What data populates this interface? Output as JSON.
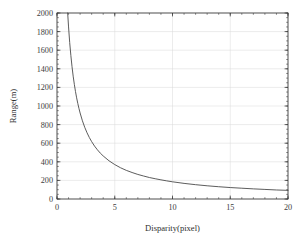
{
  "chart_data": {
    "type": "line",
    "title": "",
    "subtitle": "",
    "xlabel": "Disparity(pixel)",
    "ylabel": "Range(m)",
    "xlim": [
      0,
      20
    ],
    "ylim": [
      0,
      2000
    ],
    "xticks": [
      0,
      5,
      10,
      15,
      20
    ],
    "xtick_labels": [
      "0",
      "5",
      "10",
      "15",
      "20"
    ],
    "yticks": [
      0,
      200,
      400,
      600,
      800,
      1000,
      1200,
      1400,
      1600,
      1800,
      2000
    ],
    "ytick_labels": [
      "0",
      "200",
      "400",
      "600",
      "800",
      "1000",
      "1200",
      "1400",
      "1600",
      "1800",
      "2000"
    ],
    "x_minor_tick_step": 1,
    "y_minor_tick_step": 50,
    "grid": true,
    "grid_color": "#d8d8d8",
    "legend": null,
    "legend_position": "none",
    "line_color": "#4a4a4a",
    "frame_color": "#3a3a3a",
    "background_color": "#ffffff",
    "relation": "Range = 1850 / Disparity",
    "series": [
      {
        "name": "range-vs-disparity",
        "x": [
          0.925,
          1.0,
          1.1,
          1.2,
          1.3,
          1.4,
          1.5,
          1.6,
          1.7,
          1.8,
          1.9,
          2.0,
          2.2,
          2.4,
          2.6,
          2.8,
          3.0,
          3.25,
          3.5,
          3.75,
          4.0,
          4.5,
          5.0,
          5.5,
          6.0,
          6.5,
          7.0,
          7.5,
          8.0,
          8.5,
          9.0,
          9.5,
          10.0,
          11.0,
          12.0,
          13.0,
          14.0,
          15.0,
          16.0,
          17.0,
          18.0,
          19.0,
          20.0
        ],
        "y": [
          2000,
          1850,
          1682,
          1542,
          1423,
          1321,
          1233,
          1156,
          1088,
          1028,
          974,
          925,
          841,
          771,
          712,
          661,
          617,
          569,
          529,
          493,
          463,
          411,
          370,
          336,
          308,
          285,
          264,
          247,
          231,
          218,
          206,
          195,
          185,
          168,
          154,
          142,
          132,
          123,
          116,
          109,
          103,
          97,
          93
        ]
      }
    ]
  },
  "axes": {
    "x_title": "Disparity(pixel)",
    "y_title": "Range(m)"
  }
}
